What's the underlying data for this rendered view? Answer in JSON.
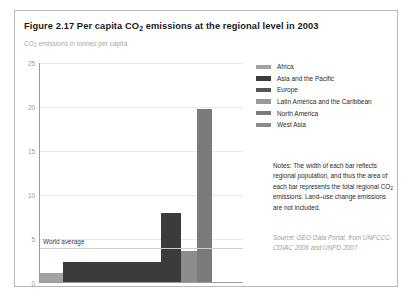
{
  "figure": {
    "title_prefix": "Figure 2.17 Per capita CO",
    "title_sub": "2",
    "title_suffix": " emissions at the regional level in 2003",
    "subtitle_prefix": "CO",
    "subtitle_sub": "2",
    "subtitle_suffix": " emissions in tonnes per capita"
  },
  "legend": {
    "items": [
      {
        "label": "Africa",
        "color": "#a3a3a3"
      },
      {
        "label": "Asia and the Pacific",
        "color": "#3b3b3b"
      },
      {
        "label": "Europe",
        "color": "#555555"
      },
      {
        "label": "Latin America and the Caribbean",
        "color": "#9a9a9a"
      },
      {
        "label": "North America",
        "color": "#7a7a7a"
      },
      {
        "label": "West Asia",
        "color": "#8c8c8c"
      }
    ]
  },
  "notes": {
    "text_before": "Notes: The width of each bar reflects regional population, and thus the area of each bar represents the total regional CO",
    "text_sub": "2",
    "text_after": " emissions. Land–use change emissions are not included."
  },
  "source": {
    "text": "Source: GEO Data Portal, from UNFCCC-CDIAC 2006 and UNPD 2007"
  },
  "chart_data": {
    "type": "bar",
    "title": "Figure 2.17 Per capita CO2 emissions at the regional level in 2003",
    "subtitle": "CO2 emissions in tonnes per capita",
    "xlabel": "",
    "ylabel": "CO2 emissions in tonnes per capita",
    "ylim": [
      0,
      25
    ],
    "yticks": [
      0,
      5,
      10,
      15,
      20,
      25
    ],
    "grid": true,
    "legend_position": "right",
    "note": "Bar width is proportional to regional population; bar area equals total regional CO2 emissions.",
    "world_average": {
      "label": "World average",
      "value": 4.0
    },
    "categories": [
      "Africa",
      "Asia and the Pacific",
      "Latin America and the Caribbean",
      "Europe",
      "West Asia",
      "North America"
    ],
    "values": [
      1.0,
      2.3,
      2.3,
      7.8,
      3.5,
      19.7
    ],
    "widths_percent": [
      11.5,
      39.0,
      9.0,
      9.5,
      8.0,
      7.5
    ],
    "bars": [
      {
        "region": "Africa",
        "value": 1.0,
        "x_start_percent": 0.0,
        "width_percent": 11.5,
        "color": "#a3a3a3"
      },
      {
        "region": "Asia and the Pacific",
        "value": 2.3,
        "x_start_percent": 11.5,
        "width_percent": 39.0,
        "color": "#3b3b3b"
      },
      {
        "region": "Latin America and the Caribbean",
        "value": 2.3,
        "x_start_percent": 50.5,
        "width_percent": 9.0,
        "color": "#3b3b3b"
      },
      {
        "region": "Europe",
        "value": 7.8,
        "x_start_percent": 59.5,
        "width_percent": 9.5,
        "color": "#3b3b3b"
      },
      {
        "region": "West Asia",
        "value": 3.5,
        "x_start_percent": 69.0,
        "width_percent": 8.0,
        "color": "#8c8c8c"
      },
      {
        "region": "North America",
        "value": 19.7,
        "x_start_percent": 77.0,
        "width_percent": 7.5,
        "color": "#7a7a7a"
      }
    ]
  }
}
